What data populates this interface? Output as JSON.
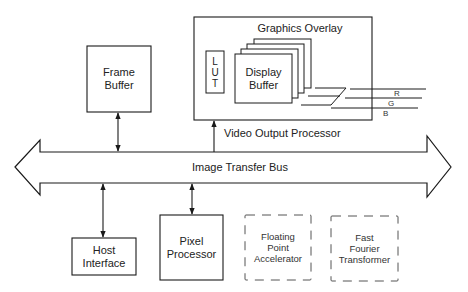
{
  "diagram": {
    "bus": {
      "label": "Image Transfer Bus"
    },
    "blocks": {
      "frame_buffer": {
        "lines": [
          "Frame",
          "Buffer"
        ]
      },
      "video_output_processor": {
        "label": "Video Output Processor",
        "graphics_overlay": "Graphics Overlay",
        "lut": [
          "L",
          "U",
          "T"
        ],
        "display_buffer": [
          "Display",
          "Buffer"
        ],
        "outputs": [
          "R",
          "G",
          "B"
        ]
      },
      "host_interface": {
        "lines": [
          "Host",
          "Interface"
        ]
      },
      "pixel_processor": {
        "lines": [
          "Pixel",
          "Processor"
        ]
      },
      "floating_point_accelerator": {
        "lines": [
          "Floating",
          "Point",
          "Accelerator"
        ],
        "optional": true
      },
      "fast_fourier_transformer": {
        "lines": [
          "Fast",
          "Fourier",
          "Transformer"
        ],
        "optional": true
      }
    },
    "connections": [
      {
        "from": "frame_buffer",
        "to": "bus",
        "type": "bidirectional"
      },
      {
        "from": "bus",
        "to": "video_output_processor",
        "type": "unidirectional"
      },
      {
        "from": "host_interface",
        "to": "bus",
        "type": "bidirectional"
      },
      {
        "from": "pixel_processor",
        "to": "bus",
        "type": "bidirectional"
      }
    ]
  }
}
